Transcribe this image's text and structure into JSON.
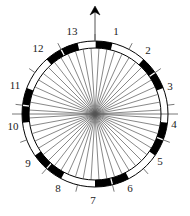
{
  "figure": {
    "kind": "circular-rose-diagram",
    "background_color": "#ffffff",
    "stroke_color": "#000000",
    "spoke_color": "#555555",
    "center": {
      "x": 95,
      "y": 114
    },
    "outer_radius": 73,
    "inner_radius": 66,
    "ring_band_color_dark": "#000000",
    "ring_band_color_light": "#ffffff"
  },
  "north_arrow": {
    "name": "north-arrow",
    "tip_y": 6,
    "base_y": 41,
    "x": 95
  },
  "horizontal_axis": {
    "name": "horizontal-diameter",
    "y": 114,
    "x_start": 12,
    "x_end": 178
  },
  "chart_data": {
    "type": "pie",
    "title": "",
    "subtitle": "",
    "xlabel": "",
    "ylabel": "",
    "legend_position": "none",
    "grid": false,
    "n_sectors": 13,
    "sector_span_degrees": 27.692,
    "start_angle_degrees": 0,
    "angle_direction": "clockwise-from-north",
    "radial_spokes_total": 52,
    "radial_spokes_per_sector": 4,
    "categories": [
      "1",
      "2",
      "3",
      "4",
      "5",
      "6",
      "7",
      "8",
      "9",
      "10",
      "11",
      "12",
      "13"
    ],
    "values": [
      1,
      1,
      1,
      1,
      1,
      1,
      1,
      1,
      1,
      1,
      1,
      1,
      1
    ],
    "band_fill_pattern": [
      "dark",
      "light",
      "dark",
      "light",
      "dark",
      "light",
      "dark",
      "light",
      "dark",
      "light",
      "dark",
      "light",
      "dark"
    ],
    "tick_marks_at_sector_boundaries": true,
    "labels": [
      {
        "text": "1",
        "x": 116,
        "y": 31,
        "angle_deg": 13.8
      },
      {
        "text": "2",
        "x": 148,
        "y": 50,
        "angle_deg": 41.5
      },
      {
        "text": "3",
        "x": 170,
        "y": 86,
        "angle_deg": 69.2
      },
      {
        "text": "4",
        "x": 174,
        "y": 124,
        "angle_deg": 96.9
      },
      {
        "text": "5",
        "x": 160,
        "y": 161,
        "angle_deg": 124.6
      },
      {
        "text": "6",
        "x": 130,
        "y": 188,
        "angle_deg": 152.3
      },
      {
        "text": "7",
        "x": 93,
        "y": 200,
        "angle_deg": 180.0
      },
      {
        "text": "8",
        "x": 58,
        "y": 188,
        "angle_deg": 207.7
      },
      {
        "text": "9",
        "x": 28,
        "y": 163,
        "angle_deg": 235.4
      },
      {
        "text": "10",
        "x": 13,
        "y": 126,
        "angle_deg": 263.1
      },
      {
        "text": "11",
        "x": 15,
        "y": 85,
        "angle_deg": 290.8
      },
      {
        "text": "12",
        "x": 38,
        "y": 48,
        "angle_deg": 318.5
      },
      {
        "text": "13",
        "x": 72,
        "y": 31,
        "angle_deg": 346.2
      }
    ]
  }
}
